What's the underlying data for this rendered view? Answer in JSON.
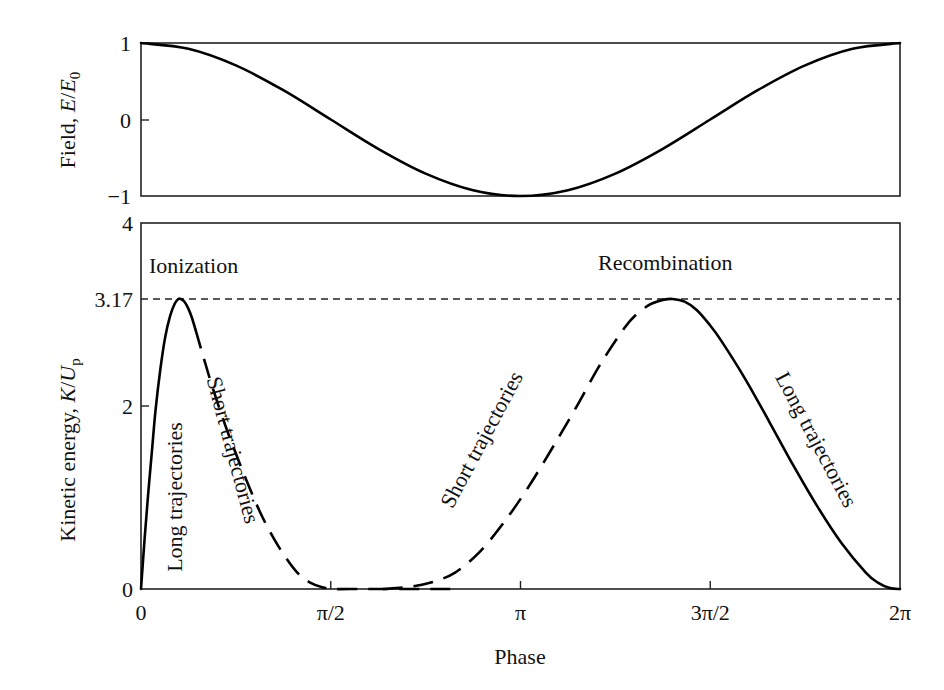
{
  "figure": {
    "x_axis_title": "Phase",
    "top_panel": {
      "y_axis_title_main": "Field, ",
      "y_axis_title_var": "E",
      "y_axis_title_sep": "/",
      "y_axis_title_var2": "E",
      "y_axis_title_sub": "0",
      "y_ticks": [
        "1",
        "0",
        "−1"
      ]
    },
    "bottom_panel": {
      "y_axis_title_main": "Kinetic energy, ",
      "y_axis_title_var": "K",
      "y_axis_title_sep": "/",
      "y_axis_title_var2": "U",
      "y_axis_title_sub": "p",
      "y_ticks": [
        "4",
        "3.17",
        "2",
        "0"
      ],
      "annotations": {
        "ionization": "Ionization",
        "recombination": "Recombination",
        "long_left": "Long trajectories",
        "short_left": "Short trajectories",
        "short_right": "Short trajectories",
        "long_right": "Long trajectories"
      }
    },
    "x_ticks": [
      "0",
      "π/2",
      "π",
      "3π/2",
      "2π"
    ]
  },
  "chart_data": [
    {
      "type": "line",
      "title": "",
      "xlabel": "Phase",
      "ylabel": "Field, E/E0",
      "x_ticks": [
        "0",
        "π/2",
        "π",
        "3π/2",
        "2π"
      ],
      "xlim": [
        0,
        6.2832
      ],
      "ylim": [
        -1,
        1
      ],
      "y_ticks": [
        -1,
        0,
        1
      ],
      "grid": false,
      "series": [
        {
          "name": "Field E/E0 = cos(phase)",
          "style": "solid",
          "x": [
            0,
            0.3927,
            0.7854,
            1.1781,
            1.5708,
            1.9635,
            2.3562,
            2.7489,
            3.1416,
            3.5343,
            3.927,
            4.3197,
            4.7124,
            5.1051,
            5.4978,
            5.8905,
            6.2832
          ],
          "y": [
            1,
            0.924,
            0.707,
            0.383,
            0,
            -0.383,
            -0.707,
            -0.924,
            -1,
            -0.924,
            -0.707,
            -0.383,
            0,
            0.383,
            0.707,
            0.924,
            1
          ]
        }
      ]
    },
    {
      "type": "line",
      "title": "",
      "xlabel": "Phase",
      "ylabel": "Kinetic energy, K/Up",
      "x_ticks": [
        "0",
        "π/2",
        "π",
        "3π/2",
        "2π"
      ],
      "xlim": [
        0,
        6.2832
      ],
      "ylim": [
        0,
        4
      ],
      "y_ticks": [
        0,
        2,
        3.17,
        4
      ],
      "grid": false,
      "reference_lines": [
        {
          "y": 3.17,
          "style": "dashed",
          "label": "3.17"
        }
      ],
      "annotations": [
        "Ionization",
        "Recombination",
        "Long trajectories",
        "Short trajectories",
        "Short trajectories",
        "Long trajectories"
      ],
      "series": [
        {
          "name": "Long trajectories (ionization phase)",
          "style": "solid",
          "x": [
            0.0,
            0.03,
            0.06,
            0.09,
            0.12,
            0.16,
            0.2,
            0.24,
            0.28,
            0.31,
            0.33,
            0.36,
            0.39,
            0.42,
            0.45
          ],
          "y": [
            0.0,
            0.55,
            1.05,
            1.5,
            1.95,
            2.4,
            2.75,
            2.98,
            3.12,
            3.17,
            3.17,
            3.14,
            3.07,
            2.97,
            2.84
          ]
        },
        {
          "name": "Short trajectories (ionization phase)",
          "style": "dashed",
          "x": [
            0.45,
            0.52,
            0.6,
            0.7,
            0.8,
            0.9,
            1.0,
            1.1,
            1.2,
            1.3,
            1.4,
            1.5,
            1.6,
            1.8,
            2.0,
            2.2,
            2.4,
            2.6
          ],
          "y": [
            2.84,
            2.52,
            2.17,
            1.78,
            1.43,
            1.1,
            0.8,
            0.55,
            0.34,
            0.17,
            0.07,
            0.02,
            0.0,
            0.0,
            0.0,
            0.0,
            0.0,
            0.0
          ]
        },
        {
          "name": "Short trajectories (recombination phase)",
          "style": "dashed",
          "x": [
            2.0,
            2.2,
            2.4,
            2.6,
            2.8,
            3.0,
            3.2,
            3.4,
            3.6,
            3.8,
            4.0,
            4.1,
            4.2,
            4.25
          ],
          "y": [
            0.0,
            0.02,
            0.07,
            0.18,
            0.4,
            0.72,
            1.1,
            1.53,
            1.98,
            2.45,
            2.85,
            3.0,
            3.1,
            3.13
          ]
        },
        {
          "name": "Long trajectories (recombination phase)",
          "style": "solid",
          "x": [
            4.25,
            4.32,
            4.4,
            4.5,
            4.6,
            4.7,
            4.8,
            5.0,
            5.2,
            5.4,
            5.6,
            5.8,
            6.0,
            6.1,
            6.2,
            6.2832
          ],
          "y": [
            3.13,
            3.16,
            3.17,
            3.14,
            3.05,
            2.9,
            2.72,
            2.3,
            1.83,
            1.35,
            0.9,
            0.5,
            0.18,
            0.07,
            0.01,
            0.0
          ]
        }
      ]
    }
  ]
}
